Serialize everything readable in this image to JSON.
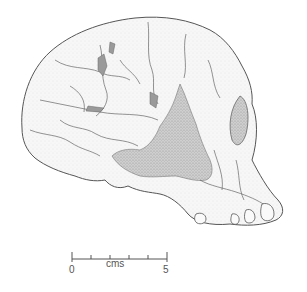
{
  "figure": {
    "colors": {
      "line": "#555555",
      "fill": "#f4f4f4",
      "shade": "#c8c8c8",
      "background": "#ffffff"
    }
  },
  "scale_bar": {
    "start_label": "0",
    "end_label": "5",
    "unit_label": "cms",
    "divisions": 5
  }
}
